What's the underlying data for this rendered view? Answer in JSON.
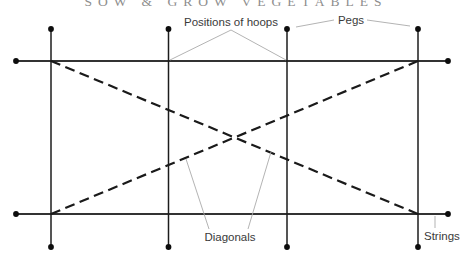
{
  "header": {
    "title": "SOW & GROW VEGETABLES"
  },
  "labels": {
    "positions_of_hoops": "Positions of hoops",
    "pegs": "Pegs",
    "diagonals": "Diagonals",
    "strings": "Strings"
  },
  "diagram": {
    "type": "garden-bed-marking-out-plan",
    "strings_count": 2,
    "hoop_positions_count": 4,
    "diagonals_count": 2,
    "pegs_count": 12
  },
  "colors": {
    "background": "#ffffff",
    "string_line": "#333333",
    "hoop_line": "#1c1c1c",
    "diagonal_line": "#1a1a1a",
    "peg_dot": "#0d0d0d",
    "pointer_line": "#aaaaaa",
    "label_text": "#3a3a3a",
    "title_text": "#8e8e8e"
  }
}
